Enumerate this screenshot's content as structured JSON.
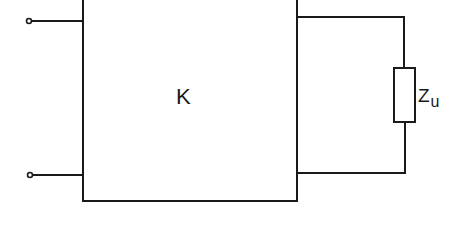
{
  "diagram": {
    "type": "circuit-block-diagram",
    "block": {
      "label": "K"
    },
    "load": {
      "label": "Z",
      "subscript": "u"
    },
    "input_terminals": 2,
    "colors": {
      "line": "#1a1a1a",
      "background": "#ffffff"
    }
  }
}
